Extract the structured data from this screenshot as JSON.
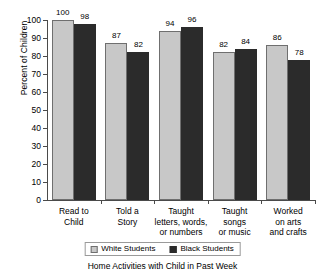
{
  "chart_data": {
    "type": "bar",
    "title": "",
    "xlabel": "Home Activities with Child in Past Week",
    "ylabel": "Percent of Children",
    "ylim": [
      0,
      100
    ],
    "ytick_step": 10,
    "grid": false,
    "legend_position": "bottom",
    "categories": [
      "Read to\nChild",
      "Told a\nStory",
      "Taught\nletters, words,\nor numbers",
      "Taught\nsongs\nor music",
      "Worked\non arts\nand crafts"
    ],
    "ytick_labels": [
      "0",
      "10",
      "20",
      "30",
      "40",
      "50",
      "60",
      "70",
      "80",
      "90",
      "100"
    ],
    "series": [
      {
        "name": "White Students",
        "color": "#c8c8c8",
        "values": [
          100,
          87,
          94,
          82,
          86
        ]
      },
      {
        "name": "Black Students",
        "color": "#2b2b2b",
        "values": [
          98,
          82,
          96,
          84,
          78
        ]
      }
    ]
  },
  "legend": {
    "items": [
      {
        "label": "White Students"
      },
      {
        "label": "Black Students"
      }
    ]
  }
}
